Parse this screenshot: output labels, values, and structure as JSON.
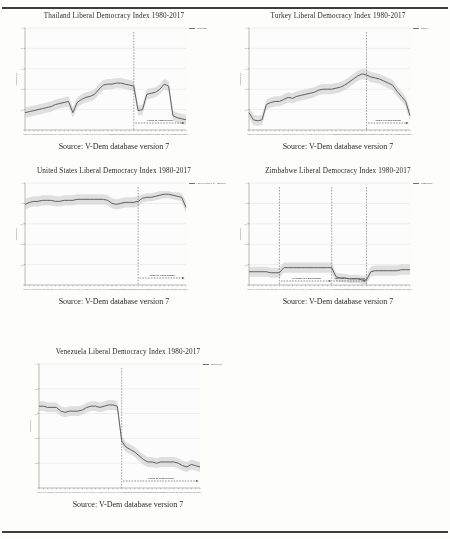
{
  "page": {
    "background": "#fdfdfb",
    "source_caption": "Source:  V-Dem database version 7",
    "axis_ylabel": "Democracy",
    "polarization_label": "Phase of Polarization",
    "polarization_label_1": "1st Phase of Polarization",
    "polarization_label_2": "2nd Phase of Polarization",
    "line_color": "#5e5e5e",
    "band_color": "#c9c9c9",
    "grid_color": "#d8d8d8"
  },
  "chart_data": [
    {
      "id": "thailand",
      "type": "line",
      "title": "Thailand Liberal Democracy Index 1980-2017",
      "legend": [
        "Thailand"
      ],
      "xlabel": "",
      "ylabel": "Democracy",
      "ylim": [
        0,
        1
      ],
      "yticks": [
        0,
        0.2,
        0.4,
        0.6,
        0.8,
        1
      ],
      "ytick_labels": [
        ".2",
        ".4",
        ".6",
        ".8",
        "1"
      ],
      "xlim": [
        1980,
        2017
      ],
      "x": [
        1980,
        1981,
        1982,
        1983,
        1984,
        1985,
        1986,
        1987,
        1988,
        1989,
        1990,
        1991,
        1992,
        1993,
        1994,
        1995,
        1996,
        1997,
        1998,
        1999,
        2000,
        2001,
        2002,
        2003,
        2004,
        2005,
        2006,
        2007,
        2008,
        2009,
        2010,
        2011,
        2012,
        2013,
        2014,
        2015,
        2016,
        2017
      ],
      "values": [
        0.17,
        0.18,
        0.19,
        0.2,
        0.21,
        0.22,
        0.23,
        0.25,
        0.26,
        0.27,
        0.28,
        0.17,
        0.27,
        0.3,
        0.32,
        0.33,
        0.35,
        0.4,
        0.44,
        0.45,
        0.45,
        0.46,
        0.46,
        0.45,
        0.44,
        0.43,
        0.19,
        0.2,
        0.35,
        0.36,
        0.37,
        0.4,
        0.45,
        0.43,
        0.14,
        0.12,
        0.11,
        0.1
      ],
      "band_upper": [
        0.22,
        0.23,
        0.24,
        0.25,
        0.26,
        0.27,
        0.28,
        0.3,
        0.31,
        0.32,
        0.33,
        0.22,
        0.32,
        0.35,
        0.37,
        0.38,
        0.4,
        0.45,
        0.49,
        0.5,
        0.5,
        0.51,
        0.51,
        0.5,
        0.49,
        0.48,
        0.24,
        0.25,
        0.4,
        0.41,
        0.42,
        0.45,
        0.5,
        0.48,
        0.19,
        0.17,
        0.16,
        0.15
      ],
      "band_lower": [
        0.12,
        0.13,
        0.14,
        0.15,
        0.16,
        0.17,
        0.18,
        0.2,
        0.21,
        0.22,
        0.23,
        0.12,
        0.22,
        0.25,
        0.27,
        0.28,
        0.3,
        0.35,
        0.39,
        0.4,
        0.4,
        0.41,
        0.41,
        0.4,
        0.39,
        0.38,
        0.14,
        0.15,
        0.3,
        0.31,
        0.32,
        0.35,
        0.4,
        0.38,
        0.09,
        0.07,
        0.06,
        0.05
      ],
      "polarization_start": 2005,
      "polarization_label": "Phase of Polarization",
      "grid": true
    },
    {
      "id": "turkey",
      "type": "line",
      "title": "Turkey Liberal Democracy Index 1980-2017",
      "legend": [
        "Turkey"
      ],
      "xlabel": "",
      "ylabel": "Democracy",
      "ylim": [
        0,
        1
      ],
      "yticks": [
        0,
        0.2,
        0.4,
        0.6,
        0.8,
        1
      ],
      "ytick_labels": [
        ".2",
        ".4",
        ".6",
        ".8",
        "1"
      ],
      "xlim": [
        1980,
        2017
      ],
      "x": [
        1980,
        1981,
        1982,
        1983,
        1984,
        1985,
        1986,
        1987,
        1988,
        1989,
        1990,
        1991,
        1992,
        1993,
        1994,
        1995,
        1996,
        1997,
        1998,
        1999,
        2000,
        2001,
        2002,
        2003,
        2004,
        2005,
        2006,
        2007,
        2008,
        2009,
        2010,
        2011,
        2012,
        2013,
        2014,
        2015,
        2016,
        2017
      ],
      "values": [
        0.17,
        0.1,
        0.09,
        0.1,
        0.25,
        0.27,
        0.28,
        0.28,
        0.3,
        0.32,
        0.31,
        0.33,
        0.34,
        0.35,
        0.36,
        0.37,
        0.39,
        0.4,
        0.4,
        0.4,
        0.41,
        0.42,
        0.44,
        0.47,
        0.5,
        0.53,
        0.55,
        0.54,
        0.52,
        0.51,
        0.5,
        0.48,
        0.46,
        0.44,
        0.38,
        0.33,
        0.28,
        0.14
      ],
      "band_upper": [
        0.22,
        0.15,
        0.14,
        0.15,
        0.3,
        0.32,
        0.33,
        0.33,
        0.35,
        0.37,
        0.36,
        0.38,
        0.39,
        0.4,
        0.41,
        0.42,
        0.44,
        0.45,
        0.45,
        0.45,
        0.46,
        0.47,
        0.49,
        0.52,
        0.55,
        0.58,
        0.6,
        0.59,
        0.57,
        0.56,
        0.55,
        0.53,
        0.51,
        0.49,
        0.43,
        0.38,
        0.33,
        0.19
      ],
      "band_lower": [
        0.12,
        0.05,
        0.04,
        0.05,
        0.2,
        0.22,
        0.23,
        0.23,
        0.25,
        0.27,
        0.26,
        0.28,
        0.29,
        0.3,
        0.31,
        0.32,
        0.34,
        0.35,
        0.35,
        0.35,
        0.36,
        0.37,
        0.39,
        0.42,
        0.45,
        0.48,
        0.5,
        0.49,
        0.47,
        0.46,
        0.45,
        0.43,
        0.41,
        0.39,
        0.33,
        0.28,
        0.23,
        0.09
      ],
      "polarization_start": 2007,
      "polarization_label": "Phase of Polarization",
      "grid": true
    },
    {
      "id": "united-states",
      "type": "line",
      "title": "United States Liberal Democracy Index 1980-2017",
      "legend": [
        "United States of America"
      ],
      "xlabel": "",
      "ylabel": "Democracy",
      "ylim": [
        0,
        1
      ],
      "yticks": [
        0,
        0.2,
        0.4,
        0.6,
        0.8,
        1
      ],
      "ytick_labels": [
        ".2",
        ".4",
        ".6",
        ".8",
        "1"
      ],
      "xlim": [
        1980,
        2017
      ],
      "x": [
        1980,
        1981,
        1982,
        1983,
        1984,
        1985,
        1986,
        1987,
        1988,
        1989,
        1990,
        1991,
        1992,
        1993,
        1994,
        1995,
        1996,
        1997,
        1998,
        1999,
        2000,
        2001,
        2002,
        2003,
        2004,
        2005,
        2006,
        2007,
        2008,
        2009,
        2010,
        2011,
        2012,
        2013,
        2014,
        2015,
        2016,
        2017
      ],
      "values": [
        0.79,
        0.81,
        0.82,
        0.82,
        0.83,
        0.83,
        0.83,
        0.82,
        0.82,
        0.83,
        0.83,
        0.83,
        0.84,
        0.84,
        0.84,
        0.84,
        0.84,
        0.84,
        0.84,
        0.83,
        0.8,
        0.79,
        0.8,
        0.81,
        0.81,
        0.81,
        0.82,
        0.85,
        0.86,
        0.86,
        0.87,
        0.88,
        0.89,
        0.89,
        0.88,
        0.87,
        0.86,
        0.76
      ],
      "band_upper": [
        0.84,
        0.86,
        0.87,
        0.87,
        0.88,
        0.88,
        0.88,
        0.87,
        0.87,
        0.88,
        0.88,
        0.88,
        0.89,
        0.89,
        0.89,
        0.89,
        0.89,
        0.89,
        0.89,
        0.88,
        0.85,
        0.84,
        0.85,
        0.86,
        0.86,
        0.86,
        0.87,
        0.89,
        0.9,
        0.9,
        0.91,
        0.92,
        0.92,
        0.92,
        0.91,
        0.91,
        0.9,
        0.82
      ],
      "band_lower": [
        0.74,
        0.76,
        0.77,
        0.77,
        0.78,
        0.78,
        0.78,
        0.77,
        0.77,
        0.78,
        0.78,
        0.78,
        0.79,
        0.79,
        0.79,
        0.79,
        0.79,
        0.79,
        0.79,
        0.78,
        0.75,
        0.74,
        0.75,
        0.76,
        0.76,
        0.76,
        0.77,
        0.81,
        0.82,
        0.82,
        0.83,
        0.84,
        0.85,
        0.85,
        0.84,
        0.83,
        0.82,
        0.7
      ],
      "polarization_start": 2006,
      "polarization_label": "Phase of Polarization",
      "grid": true
    },
    {
      "id": "zimbabwe",
      "type": "line",
      "title": "Zimbabwe Liberal Democracy Index 1980-2017",
      "legend": [
        "Zimbabwe"
      ],
      "xlabel": "",
      "ylabel": "Democracy",
      "ylim": [
        0,
        1
      ],
      "yticks": [
        0,
        0.2,
        0.4,
        0.6,
        0.8,
        1
      ],
      "ytick_labels": [
        ".2",
        ".4",
        ".6",
        ".8",
        "1"
      ],
      "xlim": [
        1980,
        2017
      ],
      "x": [
        1980,
        1981,
        1982,
        1983,
        1984,
        1985,
        1986,
        1987,
        1988,
        1989,
        1990,
        1991,
        1992,
        1993,
        1994,
        1995,
        1996,
        1997,
        1998,
        1999,
        2000,
        2001,
        2002,
        2003,
        2004,
        2005,
        2006,
        2007,
        2008,
        2009,
        2010,
        2011,
        2012,
        2013,
        2014,
        2015,
        2016,
        2017
      ],
      "values": [
        0.13,
        0.13,
        0.13,
        0.13,
        0.13,
        0.12,
        0.12,
        0.12,
        0.17,
        0.17,
        0.17,
        0.17,
        0.17,
        0.17,
        0.17,
        0.17,
        0.17,
        0.17,
        0.17,
        0.17,
        0.08,
        0.07,
        0.07,
        0.06,
        0.06,
        0.06,
        0.05,
        0.05,
        0.13,
        0.14,
        0.14,
        0.14,
        0.14,
        0.14,
        0.14,
        0.15,
        0.15,
        0.15
      ],
      "band_upper": [
        0.18,
        0.18,
        0.18,
        0.18,
        0.18,
        0.17,
        0.17,
        0.17,
        0.22,
        0.22,
        0.22,
        0.22,
        0.22,
        0.22,
        0.22,
        0.22,
        0.22,
        0.22,
        0.22,
        0.22,
        0.12,
        0.11,
        0.11,
        0.1,
        0.1,
        0.1,
        0.09,
        0.09,
        0.18,
        0.19,
        0.19,
        0.19,
        0.19,
        0.19,
        0.19,
        0.2,
        0.2,
        0.2
      ],
      "band_lower": [
        0.08,
        0.08,
        0.08,
        0.08,
        0.08,
        0.07,
        0.07,
        0.07,
        0.12,
        0.12,
        0.12,
        0.12,
        0.12,
        0.12,
        0.12,
        0.12,
        0.12,
        0.12,
        0.12,
        0.12,
        0.04,
        0.03,
        0.03,
        0.02,
        0.02,
        0.02,
        0.01,
        0.01,
        0.08,
        0.09,
        0.09,
        0.09,
        0.09,
        0.09,
        0.09,
        0.1,
        0.1,
        0.1
      ],
      "polarization_markers": [
        1987,
        1999,
        2007
      ],
      "polarization_labels": [
        "1st Phase of Polarization",
        "2nd Phase of Polarization"
      ],
      "grid": true
    },
    {
      "id": "venezuela",
      "type": "line",
      "title": "Venezuela Liberal Democracy Index 1980-2017",
      "legend": [
        "Venezuela"
      ],
      "xlabel": "",
      "ylabel": "Democracy",
      "ylim": [
        0,
        1
      ],
      "yticks": [
        0,
        0.2,
        0.4,
        0.6,
        0.8,
        1
      ],
      "ytick_labels": [
        ".2",
        ".4",
        ".6",
        ".8",
        "1"
      ],
      "xlim": [
        1980,
        2017
      ],
      "x": [
        1980,
        1981,
        1982,
        1983,
        1984,
        1985,
        1986,
        1987,
        1988,
        1989,
        1990,
        1991,
        1992,
        1993,
        1994,
        1995,
        1996,
        1997,
        1998,
        1999,
        2000,
        2001,
        2002,
        2003,
        2004,
        2005,
        2006,
        2007,
        2008,
        2009,
        2010,
        2011,
        2012,
        2013,
        2014,
        2015,
        2016,
        2017
      ],
      "values": [
        0.66,
        0.66,
        0.65,
        0.65,
        0.65,
        0.62,
        0.61,
        0.62,
        0.62,
        0.62,
        0.63,
        0.65,
        0.66,
        0.66,
        0.65,
        0.66,
        0.67,
        0.67,
        0.66,
        0.38,
        0.33,
        0.31,
        0.29,
        0.26,
        0.23,
        0.21,
        0.21,
        0.2,
        0.21,
        0.21,
        0.21,
        0.21,
        0.2,
        0.18,
        0.17,
        0.19,
        0.18,
        0.17
      ],
      "band_upper": [
        0.7,
        0.7,
        0.69,
        0.69,
        0.69,
        0.66,
        0.65,
        0.66,
        0.66,
        0.66,
        0.67,
        0.69,
        0.7,
        0.7,
        0.69,
        0.7,
        0.71,
        0.71,
        0.7,
        0.42,
        0.37,
        0.35,
        0.33,
        0.3,
        0.27,
        0.25,
        0.25,
        0.24,
        0.25,
        0.25,
        0.25,
        0.25,
        0.24,
        0.22,
        0.21,
        0.23,
        0.22,
        0.21
      ],
      "band_lower": [
        0.62,
        0.62,
        0.61,
        0.61,
        0.61,
        0.58,
        0.57,
        0.58,
        0.58,
        0.58,
        0.59,
        0.61,
        0.62,
        0.62,
        0.61,
        0.62,
        0.63,
        0.63,
        0.62,
        0.34,
        0.29,
        0.27,
        0.25,
        0.22,
        0.19,
        0.17,
        0.17,
        0.16,
        0.17,
        0.17,
        0.17,
        0.17,
        0.16,
        0.14,
        0.13,
        0.15,
        0.14,
        0.13
      ],
      "polarization_start": 1999,
      "polarization_label": "Phase of Polarization",
      "grid": true
    }
  ]
}
